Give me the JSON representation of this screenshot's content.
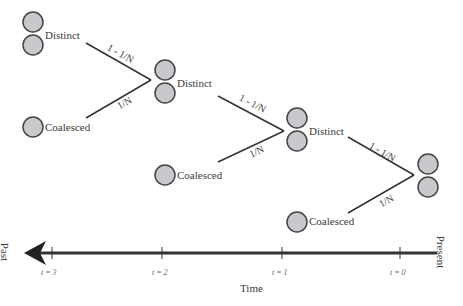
{
  "diagram": {
    "states": {
      "distinct": "Distinct",
      "coalesced": "Coalesced"
    },
    "probabilities": {
      "stay_distinct": "1 - 1/N",
      "coalesce": "1/N"
    },
    "colors": {
      "circle_fill": "#c8c9cc",
      "circle_stroke": "#444444",
      "line": "#333333"
    },
    "axis": {
      "label": "Time",
      "left_end": "Past",
      "right_end": "Present",
      "ticks": [
        "t = 3",
        "t = 2",
        "t = 1",
        "t = 0"
      ]
    }
  }
}
